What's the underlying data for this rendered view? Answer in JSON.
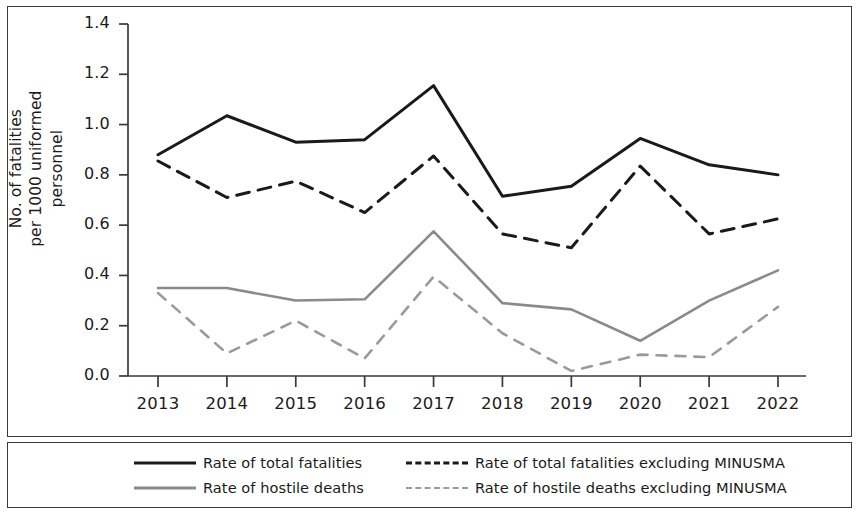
{
  "chart_data": {
    "type": "line",
    "title": "",
    "xlabel": "",
    "ylabel": "No. of fatalities\nper 1000 uniformed personnel",
    "categories": [
      "2013",
      "2014",
      "2015",
      "2016",
      "2017",
      "2018",
      "2019",
      "2020",
      "2021",
      "2022"
    ],
    "x": [
      2013,
      2014,
      2015,
      2016,
      2017,
      2018,
      2019,
      2020,
      2021,
      2022
    ],
    "ylim": [
      0.0,
      1.4
    ],
    "yticks": [
      "0.0",
      "0.2",
      "0.4",
      "0.6",
      "0.8",
      "1.0",
      "1.2",
      "1.4"
    ],
    "ytick_values": [
      0.0,
      0.2,
      0.4,
      0.6,
      0.8,
      1.0,
      1.2,
      1.4
    ],
    "grid": false,
    "legend_position": "bottom",
    "series": [
      {
        "name": "Rate of total fatalities",
        "style": "solid",
        "color": "#1a1a1a",
        "values": [
          0.88,
          1.035,
          0.93,
          0.94,
          1.155,
          0.715,
          0.755,
          0.945,
          0.84,
          0.8
        ]
      },
      {
        "name": "Rate of total fatalities excluding MINUSMA",
        "style": "dashed",
        "color": "#1a1a1a",
        "values": [
          0.855,
          0.71,
          0.775,
          0.65,
          0.875,
          0.565,
          0.51,
          0.835,
          0.565,
          0.625
        ]
      },
      {
        "name": "Rate of hostile deaths",
        "style": "solid",
        "color": "#8a8a8a",
        "values": [
          0.35,
          0.35,
          0.3,
          0.305,
          0.575,
          0.29,
          0.265,
          0.14,
          0.3,
          0.42
        ]
      },
      {
        "name": "Rate of hostile deaths excluding MINUSMA",
        "style": "dashed",
        "color": "#9a9a9a",
        "values": [
          0.33,
          0.09,
          0.22,
          0.07,
          0.395,
          0.17,
          0.02,
          0.085,
          0.075,
          0.275
        ]
      }
    ]
  },
  "legend": {
    "entries": [
      {
        "label": "Rate of total fatalities",
        "swatch": "sw-solid-black"
      },
      {
        "label": "Rate of total fatalities excluding MINUSMA",
        "swatch": "sw-dash-black"
      },
      {
        "label": "Rate of hostile deaths",
        "swatch": "sw-solid-gray"
      },
      {
        "label": "Rate of hostile deaths excluding MINUSMA",
        "swatch": "sw-dash-gray"
      }
    ]
  },
  "colors": {
    "axis": "#3a3a3a",
    "total": "#1a1a1a",
    "hostile": "#8a8a8a",
    "background": "#ffffff"
  }
}
